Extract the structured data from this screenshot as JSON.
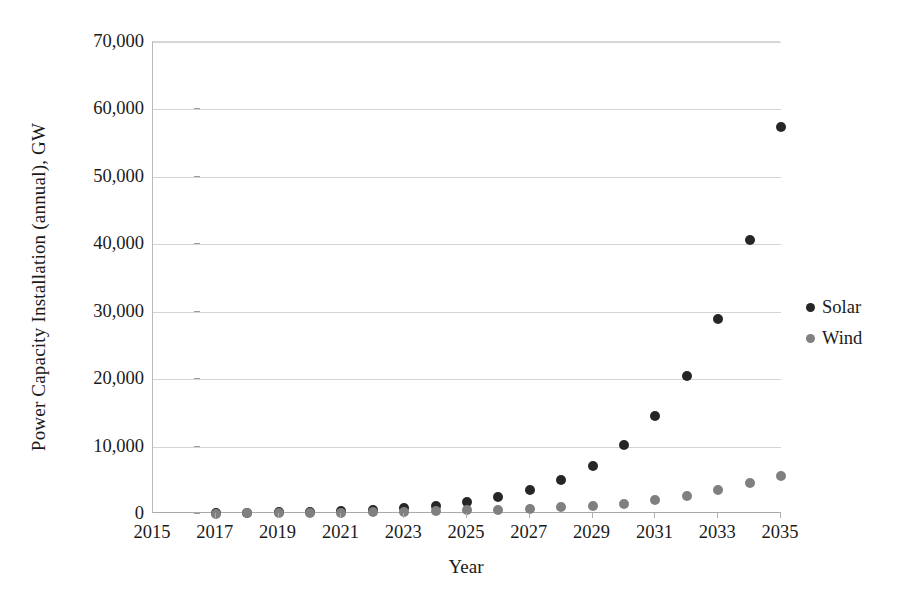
{
  "chart_data": {
    "type": "scatter",
    "title": "",
    "xlabel": "Year",
    "ylabel": "Power Capacity Installation (annual), GW",
    "xlim": [
      2015,
      2035
    ],
    "ylim": [
      0,
      70000
    ],
    "ytick_labels": [
      "0",
      "10,000",
      "20,000",
      "30,000",
      "40,000",
      "50,000",
      "60,000",
      "70,000"
    ],
    "ytick_values": [
      0,
      10000,
      20000,
      30000,
      40000,
      50000,
      60000,
      70000
    ],
    "xtick_labels": [
      "2015",
      "2017",
      "2019",
      "2021",
      "2023",
      "2025",
      "2027",
      "2029",
      "2031",
      "2033",
      "2035"
    ],
    "xtick_values": [
      2015,
      2017,
      2019,
      2021,
      2023,
      2025,
      2027,
      2029,
      2031,
      2033,
      2035
    ],
    "grid": true,
    "grid_axis": "y",
    "legend_position": "right",
    "x": [
      2017,
      2018,
      2019,
      2020,
      2021,
      2022,
      2023,
      2024,
      2025,
      2026,
      2027,
      2028,
      2029,
      2030,
      2031,
      2032,
      2033,
      2034,
      2035
    ],
    "series": [
      {
        "name": "Solar",
        "color": "#262626",
        "values": [
          120,
          180,
          260,
          350,
          480,
          650,
          900,
          1250,
          1750,
          2500,
          3550,
          5050,
          7150,
          10200,
          14500,
          20400,
          28900,
          40700,
          57400
        ]
      },
      {
        "name": "Wind",
        "color": "#808080",
        "values": [
          60,
          80,
          110,
          150,
          200,
          260,
          330,
          420,
          520,
          650,
          800,
          980,
          1200,
          1550,
          2050,
          2650,
          3550,
          4600,
          5600
        ]
      }
    ]
  },
  "legend": {
    "items": [
      {
        "label": "Solar",
        "color": "#262626"
      },
      {
        "label": "Wind",
        "color": "#808080"
      }
    ]
  }
}
